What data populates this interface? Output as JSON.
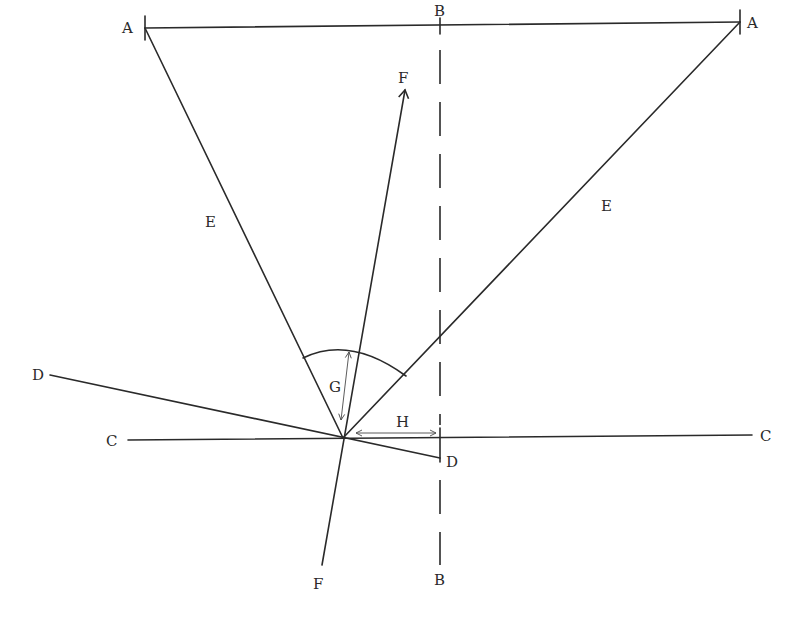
{
  "diagram": {
    "labels": {
      "a_left": "A",
      "a_right": "A",
      "b_top": "B",
      "b_bottom": "B",
      "c_left": "C",
      "c_right": "C",
      "d_left": "D",
      "d_right": "D",
      "e_left": "E",
      "e_right": "E",
      "f_top": "F",
      "f_bottom": "F",
      "g": "G",
      "h": "H"
    },
    "lines": [
      {
        "name": "A-A",
        "style": "solid",
        "from": [
          145,
          28
        ],
        "to": [
          740,
          22
        ]
      },
      {
        "name": "B-B",
        "style": "dashed",
        "from": [
          440,
          22
        ],
        "to": [
          440,
          565
        ]
      },
      {
        "name": "C-C",
        "style": "solid",
        "from": [
          128,
          440
        ],
        "to": [
          752,
          435
        ]
      },
      {
        "name": "D-D",
        "style": "solid",
        "from": [
          50,
          375
        ],
        "to": [
          440,
          458
        ]
      },
      {
        "name": "E-left",
        "style": "solid",
        "from": [
          145,
          28
        ],
        "to": [
          343,
          438
        ]
      },
      {
        "name": "E-right",
        "style": "solid",
        "from": [
          740,
          22
        ],
        "to": [
          343,
          438
        ]
      },
      {
        "name": "F-F",
        "style": "solid-arrow",
        "from": [
          322,
          565
        ],
        "to": [
          405,
          88
        ]
      }
    ],
    "annotations": {
      "angle_arc": "arc between the two E lines at the vertex",
      "G": "double arrow along F line from vertex to arc",
      "H": "double arrow along C line from vertex to B line"
    },
    "colors": {
      "stroke": "#2a2a2a",
      "background": "#ffffff"
    }
  }
}
